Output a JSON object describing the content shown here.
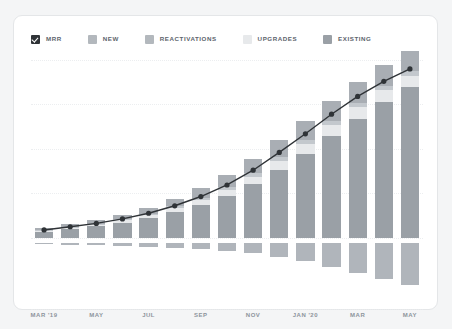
{
  "card": {
    "background": "#ffffff",
    "border_color": "#e4e6e8"
  },
  "legend": {
    "items": [
      {
        "label": "MRR",
        "color": "#2f3337",
        "checked": true,
        "swatch": "checkbox-swatch"
      },
      {
        "label": "NEW",
        "color": "#b3b8bd",
        "checked": false,
        "swatch": "square-swatch"
      },
      {
        "label": "REACTIVATIONS",
        "color": "#b3b8bd",
        "checked": false,
        "swatch": "square-swatch"
      },
      {
        "label": "UPGRADES",
        "color": "#e7e9eb",
        "checked": false,
        "swatch": "square-swatch"
      },
      {
        "label": "EXISTING",
        "color": "#9aa0a6",
        "checked": false,
        "swatch": "square-swatch"
      }
    ]
  },
  "chart_data": {
    "type": "bar",
    "title": "",
    "subtitle": "",
    "xlabel": "",
    "ylabel": "",
    "stacked": true,
    "grid": true,
    "legend_position": "top-left",
    "axis_zero_label": "0",
    "ylim": [
      -26,
      100
    ],
    "gridline_values": [
      100,
      75,
      50,
      25,
      0
    ],
    "categories": [
      "MAR '19",
      "APR '19",
      "MAY '19",
      "JUN '19",
      "JUL '19",
      "AUG '19",
      "SEP '19",
      "OCT '19",
      "NOV '19",
      "DEC '19",
      "JAN '20",
      "FEB '20",
      "MAR '20",
      "APR '20",
      "MAY '20"
    ],
    "tick_labels": [
      {
        "index": 0,
        "label": "MAR '19"
      },
      {
        "index": 2,
        "label": "MAY"
      },
      {
        "index": 4,
        "label": "JUL"
      },
      {
        "index": 6,
        "label": "SEP"
      },
      {
        "index": 8,
        "label": "NOV"
      },
      {
        "index": 10,
        "label": "JAN '20"
      },
      {
        "index": 12,
        "label": "MAR"
      },
      {
        "index": 14,
        "label": "MAY"
      }
    ],
    "series": [
      {
        "name": "EXISTING",
        "color": "#9aa0a6",
        "values": [
          3.5,
          5.0,
          6.5,
          8.5,
          11.0,
          14.5,
          18.5,
          23.5,
          30.0,
          38.0,
          47.0,
          57.0,
          67.0,
          76.5,
          85.0
        ]
      },
      {
        "name": "UPGRADES",
        "color": "#e7e9eb",
        "values": [
          0.6,
          0.8,
          1.0,
          1.3,
          1.7,
          2.2,
          2.8,
          3.6,
          4.4,
          5.2,
          5.8,
          6.2,
          6.4,
          6.4,
          6.2
        ]
      },
      {
        "name": "REACTIVATIONS",
        "color": "#c3c8cd",
        "values": [
          0.3,
          0.4,
          0.5,
          0.6,
          0.8,
          1.0,
          1.3,
          1.6,
          1.9,
          2.2,
          2.4,
          2.5,
          2.6,
          2.6,
          2.5
        ]
      },
      {
        "name": "NEW",
        "color": "#a9aeb4",
        "values": [
          1.0,
          1.4,
          1.8,
          2.4,
          3.2,
          4.2,
          5.4,
          6.8,
          8.2,
          9.4,
          10.4,
          11.0,
          11.4,
          11.5,
          11.2
        ]
      },
      {
        "name": "CHURN",
        "color": "#b0b5bb",
        "negative": true,
        "values": [
          -0.8,
          -1.0,
          -1.3,
          -1.7,
          -2.2,
          -2.8,
          -3.6,
          -4.6,
          -6.0,
          -8.0,
          -10.5,
          -13.5,
          -17.0,
          -20.5,
          -23.5
        ]
      }
    ],
    "line": {
      "name": "MRR",
      "color": "#2f3337",
      "marker": "circle",
      "values": [
        4.4,
        6.2,
        8.1,
        10.6,
        13.8,
        18.0,
        23.2,
        29.7,
        38.0,
        48.0,
        58.5,
        69.5,
        79.5,
        88.0,
        95.0
      ]
    }
  }
}
